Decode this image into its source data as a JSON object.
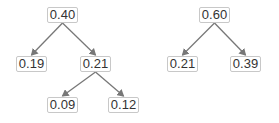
{
  "trees": [
    {
      "name": "left-tree",
      "nodes": [
        {
          "id": "a",
          "label": "0.40",
          "x": 47,
          "y": 7
        },
        {
          "id": "b",
          "label": "0.19",
          "x": 16,
          "y": 56
        },
        {
          "id": "c",
          "label": "0.21",
          "x": 80,
          "y": 56
        },
        {
          "id": "d",
          "label": "0.09",
          "x": 47,
          "y": 97
        },
        {
          "id": "e",
          "label": "0.12",
          "x": 108,
          "y": 97
        }
      ],
      "edges": [
        [
          "a",
          "b"
        ],
        [
          "a",
          "c"
        ],
        [
          "c",
          "d"
        ],
        [
          "c",
          "e"
        ]
      ]
    },
    {
      "name": "right-tree",
      "nodes": [
        {
          "id": "f",
          "label": "0.60",
          "x": 199,
          "y": 7
        },
        {
          "id": "g",
          "label": "0.21",
          "x": 167,
          "y": 56
        },
        {
          "id": "h",
          "label": "0.39",
          "x": 230,
          "y": 56
        }
      ],
      "edges": [
        [
          "f",
          "g"
        ],
        [
          "f",
          "h"
        ]
      ]
    }
  ],
  "colors": {
    "edge": "#777777",
    "border": "#c8c8c8",
    "text": "#333333"
  }
}
